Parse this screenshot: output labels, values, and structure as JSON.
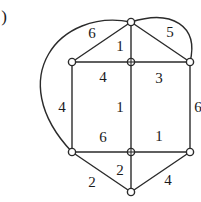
{
  "figure": {
    "marker_label": ")",
    "marker_x": 4,
    "marker_y": 16,
    "background_color": "#ffffff",
    "stroke_color": "#2b2b2b",
    "text_color": "#1a1a1a"
  },
  "graph": {
    "type": "weighted-planar-graph",
    "vertices": [
      {
        "id": "v-top",
        "name": "vertex-top",
        "x": 131,
        "y": 22,
        "style": "open-circle"
      },
      {
        "id": "v-top-left",
        "name": "vertex-top-left",
        "x": 72,
        "y": 62,
        "style": "open-circle"
      },
      {
        "id": "v-top-center",
        "name": "vertex-top-center",
        "x": 131,
        "y": 62,
        "style": "crossed-circle"
      },
      {
        "id": "v-top-right",
        "name": "vertex-top-right",
        "x": 190,
        "y": 62,
        "style": "open-circle"
      },
      {
        "id": "v-bottom-left",
        "name": "vertex-bottom-left",
        "x": 72,
        "y": 152,
        "style": "open-circle"
      },
      {
        "id": "v-bottom-center",
        "name": "vertex-bottom-center",
        "x": 131,
        "y": 152,
        "style": "crossed-circle"
      },
      {
        "id": "v-bottom-right",
        "name": "vertex-bottom-right",
        "x": 190,
        "y": 152,
        "style": "open-circle"
      },
      {
        "id": "v-bottom",
        "name": "vertex-bottom",
        "x": 131,
        "y": 192,
        "style": "open-circle"
      }
    ],
    "edges": [
      {
        "id": "e-top-left-diag",
        "name": "edge-top-left-diagonal",
        "from": "v-top",
        "to": "v-top-left",
        "shape": "line",
        "weight": "6"
      },
      {
        "id": "e-top-right-diag",
        "name": "edge-top-right-diagonal",
        "from": "v-top",
        "to": "v-top-right",
        "shape": "line",
        "weight": "5"
      },
      {
        "id": "e-top-vertical",
        "name": "edge-top-vertical",
        "from": "v-top",
        "to": "v-top-center",
        "shape": "line",
        "weight": "1"
      },
      {
        "id": "e-upper-left-horiz",
        "name": "edge-upper-left-horizontal",
        "from": "v-top-left",
        "to": "v-top-center",
        "shape": "line",
        "weight": "4"
      },
      {
        "id": "e-upper-right-horiz",
        "name": "edge-upper-right-horizontal",
        "from": "v-top-center",
        "to": "v-top-right",
        "shape": "line",
        "weight": "3"
      },
      {
        "id": "e-left-vertical",
        "name": "edge-left-vertical",
        "from": "v-top-left",
        "to": "v-bottom-left",
        "shape": "line",
        "weight": "4"
      },
      {
        "id": "e-center-vertical",
        "name": "edge-center-vertical",
        "from": "v-top-center",
        "to": "v-bottom-center",
        "shape": "line",
        "weight": "1"
      },
      {
        "id": "e-right-vertical",
        "name": "edge-right-vertical",
        "from": "v-top-right",
        "to": "v-bottom-right",
        "shape": "line",
        "weight": "6"
      },
      {
        "id": "e-lower-left-horiz",
        "name": "edge-lower-left-horizontal",
        "from": "v-bottom-left",
        "to": "v-bottom-center",
        "shape": "line",
        "weight": "6"
      },
      {
        "id": "e-lower-right-horiz",
        "name": "edge-lower-right-horizontal",
        "from": "v-bottom-center",
        "to": "v-bottom-right",
        "shape": "line",
        "weight": "1"
      },
      {
        "id": "e-bottom-left-diag",
        "name": "edge-bottom-left-diagonal",
        "from": "v-bottom-left",
        "to": "v-bottom",
        "shape": "line",
        "weight": "2"
      },
      {
        "id": "e-bottom-vertical",
        "name": "edge-bottom-vertical",
        "from": "v-bottom-center",
        "to": "v-bottom",
        "shape": "line",
        "weight": "2"
      },
      {
        "id": "e-bottom-right-diag",
        "name": "edge-bottom-right-diagonal",
        "from": "v-bottom-right",
        "to": "v-bottom",
        "shape": "line",
        "weight": "4"
      },
      {
        "id": "e-outer-left-curve",
        "name": "edge-outer-left-curve",
        "from": "v-top",
        "to": "v-bottom-left",
        "shape": "curve",
        "weight": ""
      },
      {
        "id": "e-outer-right-curve",
        "name": "edge-outer-right-curve",
        "from": "v-top",
        "to": "v-top-right",
        "shape": "curve",
        "weight": ""
      }
    ],
    "labels": [
      {
        "id": "l-6-topleft",
        "name": "edge-weight-top-left-diagonal",
        "text": "6",
        "x": 92,
        "y": 33
      },
      {
        "id": "l-5-topright",
        "name": "edge-weight-top-right-diagonal",
        "text": "5",
        "x": 170,
        "y": 32
      },
      {
        "id": "l-1-topvert",
        "name": "edge-weight-top-vertical",
        "text": "1",
        "x": 120,
        "y": 46
      },
      {
        "id": "l-4-upperleft",
        "name": "edge-weight-upper-left-square",
        "text": "4",
        "x": 103,
        "y": 77
      },
      {
        "id": "l-3-upperright",
        "name": "edge-weight-upper-right-square",
        "text": "3",
        "x": 159,
        "y": 78
      },
      {
        "id": "l-4-leftvert",
        "name": "edge-weight-left-vertical",
        "text": "4",
        "x": 62,
        "y": 107
      },
      {
        "id": "l-1-centervert",
        "name": "edge-weight-center-vertical",
        "text": "1",
        "x": 120,
        "y": 107
      },
      {
        "id": "l-6-rightvert",
        "name": "edge-weight-right-vertical",
        "text": "6",
        "x": 198,
        "y": 107
      },
      {
        "id": "l-6-lowerleft",
        "name": "edge-weight-lower-left-square",
        "text": "6",
        "x": 103,
        "y": 137
      },
      {
        "id": "l-1-lowerright",
        "name": "edge-weight-lower-right-square",
        "text": "1",
        "x": 159,
        "y": 136
      },
      {
        "id": "l-2-bottomleft",
        "name": "edge-weight-bottom-left-diagonal",
        "text": "2",
        "x": 92,
        "y": 182
      },
      {
        "id": "l-2-bottomvert",
        "name": "edge-weight-bottom-vertical",
        "text": "2",
        "x": 120,
        "y": 170
      },
      {
        "id": "l-4-bottomright",
        "name": "edge-weight-bottom-right-diagonal",
        "text": "4",
        "x": 168,
        "y": 180
      }
    ]
  }
}
